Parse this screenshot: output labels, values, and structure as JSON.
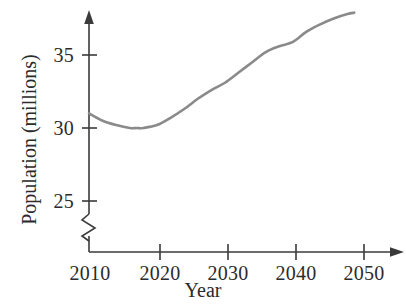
{
  "chart_data": {
    "type": "line",
    "title": "",
    "xlabel": "Year",
    "ylabel": "Population (millions)",
    "x": [
      2010,
      2012,
      2014,
      2016,
      2017,
      2018,
      2020,
      2022,
      2024,
      2026,
      2028,
      2030,
      2032,
      2034,
      2036,
      2038,
      2040,
      2042,
      2044,
      2046,
      2048,
      2049
    ],
    "values": [
      31.0,
      30.5,
      30.2,
      30.0,
      30.0,
      30.0,
      30.2,
      30.7,
      31.3,
      32.0,
      32.6,
      33.1,
      33.8,
      34.5,
      35.2,
      35.6,
      35.9,
      36.6,
      37.1,
      37.5,
      37.8,
      37.9
    ],
    "series": [
      {
        "name": "Population",
        "color": "#8a8a8a",
        "values": [
          31.0,
          30.5,
          30.2,
          30.0,
          30.0,
          30.0,
          30.2,
          30.7,
          31.3,
          32.0,
          32.6,
          33.1,
          33.8,
          34.5,
          35.2,
          35.6,
          35.9,
          36.6,
          37.1,
          37.5,
          37.8,
          37.9
        ]
      }
    ],
    "xlim": [
      2010,
      2052
    ],
    "ylim": [
      24.0,
      38.4
    ],
    "xticks": [
      2010,
      2020,
      2030,
      2040,
      2050
    ],
    "xtick_labels": [
      "2010",
      "2020",
      "2030",
      "2040",
      "2050"
    ],
    "yticks": [
      25,
      30,
      35
    ],
    "ytick_labels": [
      "25",
      "30",
      "35"
    ],
    "grid": false,
    "legend": "none",
    "axis_break": "y-axis broken below 25",
    "minimum_point": {
      "x": 2017,
      "y": 30.0
    },
    "endpoint": {
      "x": 2049,
      "y": 37.9
    }
  },
  "axes": {
    "x_title": "Year",
    "y_title": "Population (millions)",
    "x_tick_labels": [
      "2010",
      "2020",
      "2030",
      "2040",
      "2050"
    ],
    "y_tick_labels": [
      "35",
      "30",
      "25"
    ]
  },
  "colors": {
    "curve": "#8a8a8a",
    "axis": "#3a3a3a",
    "text": "#2b2b2b",
    "background": "#ffffff"
  }
}
